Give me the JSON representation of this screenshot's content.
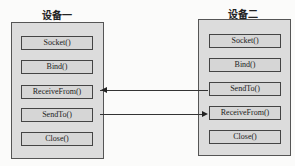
{
  "devices": [
    {
      "title": "设备一",
      "functions": [
        "Socket()",
        "Bind()",
        "ReceiveFrom()",
        "SendTo()",
        "Close()"
      ]
    },
    {
      "title": "设备二",
      "functions": [
        "Socket()",
        "Bind()",
        "SendTo()",
        "ReceiveFrom()",
        "Close()"
      ]
    }
  ],
  "arrows": [
    {
      "from": "设备二.SendTo()",
      "to": "设备一.ReceiveFrom()"
    },
    {
      "from": "设备一.SendTo()",
      "to": "设备二.ReceiveFrom()"
    }
  ],
  "colors": {
    "box_fill": "#dcdcdc",
    "stroke": "#444444",
    "background": "#fbfbfa"
  }
}
